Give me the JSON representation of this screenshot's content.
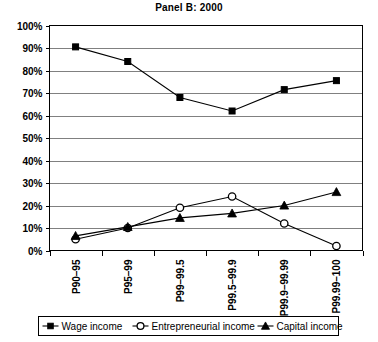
{
  "chart_data": {
    "type": "line",
    "title": "Panel B: 2000",
    "xlabel": "",
    "ylabel": "",
    "ylim": [
      0,
      100
    ],
    "ytick_labels": [
      "0%",
      "10%",
      "20%",
      "30%",
      "40%",
      "50%",
      "60%",
      "70%",
      "80%",
      "90%",
      "100%"
    ],
    "ytick_values": [
      0,
      10,
      20,
      30,
      40,
      50,
      60,
      70,
      80,
      90,
      100
    ],
    "grid": true,
    "legend_position": "bottom",
    "categories": [
      "P90–95",
      "P95–99",
      "P99–99.5",
      "P99.5–99.9",
      "P99.9–99.99",
      "P99.99–100"
    ],
    "series": [
      {
        "name": "Wage income",
        "marker": "filled-square",
        "values": [
          90.5,
          84.0,
          68.0,
          62.0,
          71.5,
          75.5
        ]
      },
      {
        "name": "Entrepreneurial income",
        "marker": "open-circle",
        "values": [
          5.0,
          10.0,
          19.0,
          24.0,
          12.0,
          2.0
        ]
      },
      {
        "name": "Capital income",
        "marker": "filled-triangle",
        "values": [
          6.5,
          10.5,
          14.5,
          16.5,
          20.0,
          26.0
        ]
      }
    ]
  },
  "legend": {
    "items": [
      {
        "label": "Wage income",
        "marker": "filled-square"
      },
      {
        "label": "Entrepreneurial income",
        "marker": "open-circle"
      },
      {
        "label": "Capital income",
        "marker": "filled-triangle"
      }
    ]
  },
  "colors": {
    "series": "#000000",
    "gridline": "#808080",
    "border": "#000000",
    "background": "#ffffff"
  }
}
